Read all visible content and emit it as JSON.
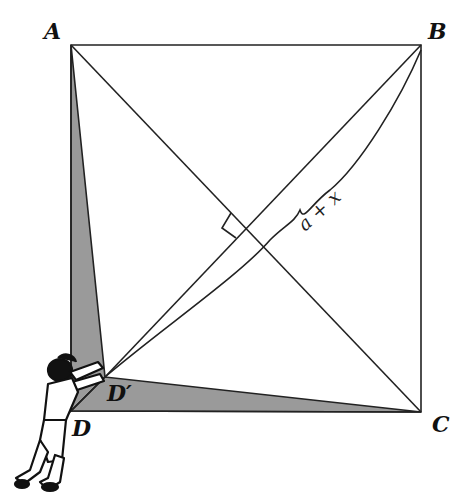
{
  "diagram": {
    "type": "geometry-square-with-diagonals",
    "vertices": {
      "A": {
        "label": "A",
        "x": 71,
        "y": 45
      },
      "B": {
        "label": "B",
        "x": 421,
        "y": 45
      },
      "C": {
        "label": "C",
        "x": 421,
        "y": 412
      },
      "D": {
        "label": "D",
        "x": 71,
        "y": 411
      },
      "D_prime": {
        "label": "D′",
        "x": 105,
        "y": 377
      }
    },
    "brace_label": "a + x",
    "shaded_color": "#9a9a9a",
    "line_color": "#222222",
    "figure": "person pushing corner D inward"
  }
}
